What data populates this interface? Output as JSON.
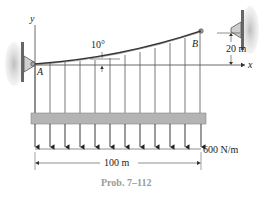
{
  "figure": {
    "caption": "Prob. 7–112",
    "labels": {
      "point_a": "A",
      "point_b": "B",
      "axis_y": "y",
      "axis_x": "x",
      "angle": "10°",
      "height": "20 m",
      "span": "100 m",
      "load": "600 N/m"
    },
    "colors": {
      "line": "#333333",
      "beam_fill": "#b4b4b4",
      "wall_fill": "#c8c8c8",
      "caption": "#9a9a9a"
    },
    "hanger_count": 12,
    "arrow_count": 12
  }
}
